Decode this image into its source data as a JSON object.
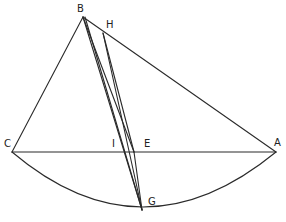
{
  "diagram": {
    "type": "geometric-construction",
    "stroke_color": "#2a2a2a",
    "label_color": "#222222",
    "points": {
      "A": {
        "label": "A",
        "x": 276,
        "y": 152,
        "lx": 274,
        "ly": 146
      },
      "B": {
        "label": "B",
        "x": 83,
        "y": 17,
        "lx": 77,
        "ly": 12
      },
      "C": {
        "label": "C",
        "x": 12,
        "y": 152,
        "lx": 4,
        "ly": 147
      },
      "E": {
        "label": "E",
        "x": 134,
        "y": 152,
        "lx": 144,
        "ly": 147
      },
      "G": {
        "label": "G",
        "x": 142,
        "y": 210,
        "lx": 148,
        "ly": 204
      },
      "H": {
        "label": "H",
        "x": 103,
        "y": 33,
        "lx": 106,
        "ly": 28
      },
      "I": {
        "label": "I",
        "x": 118,
        "y": 152,
        "lx": 112,
        "ly": 147
      }
    },
    "segments": [
      {
        "from": "B",
        "to": "C"
      },
      {
        "from": "B",
        "to": "A"
      },
      {
        "from": "C",
        "to": "A"
      },
      {
        "from": "B",
        "to": "G",
        "note": "left line through I"
      },
      {
        "from": "B",
        "to": "G",
        "note": "right line, near-parallel"
      },
      {
        "from": "H",
        "to": "E"
      },
      {
        "from": "H",
        "to": "G"
      },
      {
        "from": "E",
        "to": "G"
      }
    ],
    "arcs": [
      {
        "from": "C",
        "through": "G",
        "to": "A"
      }
    ]
  }
}
